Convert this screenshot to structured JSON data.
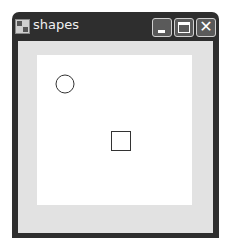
{
  "window": {
    "title": "shapes",
    "icon": "app-window-icon",
    "controls": {
      "minimize": "minimize-icon",
      "maximize": "maximize-icon",
      "close_glyph": "✕"
    }
  },
  "canvas": {
    "background": "#ffffff",
    "shapes": [
      {
        "type": "circle",
        "cx": 28,
        "cy": 29,
        "r": 9,
        "stroke": "#333333"
      },
      {
        "type": "square",
        "x": 74,
        "y": 76,
        "size": 19,
        "stroke": "#333333"
      }
    ]
  }
}
